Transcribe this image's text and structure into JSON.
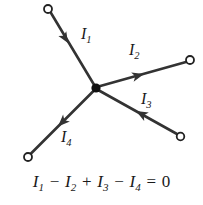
{
  "figure": {
    "type": "circuit-junction-diagram",
    "title": "",
    "stroke_color": "#333333",
    "node_color": "#111111",
    "text_color": "#1a1a1a",
    "background": "#ffffff",
    "node": {
      "x": 96,
      "y": 88,
      "radius": 4.5,
      "label": "junction"
    },
    "branches": [
      {
        "id": "I1",
        "label": "I",
        "subscript": "1",
        "direction": "into-junction",
        "terminal": {
          "x": 48,
          "y": 9,
          "radius": 4
        },
        "line": {
          "x1": 51,
          "y1": 13,
          "x2": 94,
          "y2": 85
        },
        "arrow": {
          "x": 68,
          "y": 43,
          "angle_deg": 59
        },
        "label_pos": {
          "x": 81,
          "y": 26
        }
      },
      {
        "id": "I2",
        "label": "I",
        "subscript": "2",
        "direction": "out-of-junction",
        "terminal": {
          "x": 190,
          "y": 60,
          "radius": 4
        },
        "line": {
          "x1": 99,
          "y1": 86,
          "x2": 186,
          "y2": 62
        },
        "arrow": {
          "x": 142,
          "y": 74,
          "angle_deg": -15
        },
        "label_pos": {
          "x": 129,
          "y": 42
        }
      },
      {
        "id": "I3",
        "label": "I",
        "subscript": "3",
        "direction": "into-junction",
        "terminal": {
          "x": 180,
          "y": 137,
          "radius": 4
        },
        "line": {
          "x1": 177,
          "y1": 134,
          "x2": 99,
          "y2": 91
        },
        "arrow": {
          "x": 138,
          "y": 112,
          "angle_deg": -151
        },
        "label_pos": {
          "x": 141,
          "y": 91
        }
      },
      {
        "id": "I4",
        "label": "I",
        "subscript": "4",
        "direction": "out-of-junction",
        "terminal": {
          "x": 28,
          "y": 157,
          "radius": 4
        },
        "line": {
          "x1": 94,
          "y1": 91,
          "x2": 31,
          "y2": 154
        },
        "arrow": {
          "x": 60,
          "y": 125,
          "angle_deg": 135
        },
        "label_pos": {
          "x": 61,
          "y": 129
        }
      }
    ]
  },
  "equation": {
    "text": "I1 - I2 + I3 - I4 = 0",
    "terms": [
      {
        "symbol": "I",
        "sub": "1",
        "op_before": ""
      },
      {
        "symbol": "I",
        "sub": "2",
        "op_before": "−"
      },
      {
        "symbol": "I",
        "sub": "3",
        "op_before": "+"
      },
      {
        "symbol": "I",
        "sub": "4",
        "op_before": "−"
      }
    ],
    "equals": "=",
    "rhs": "0"
  }
}
